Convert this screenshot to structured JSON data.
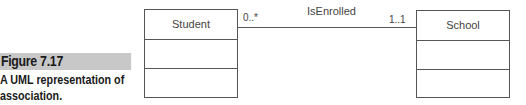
{
  "caption": {
    "figure_label": "Figure 7.17",
    "text": "A UML representation of association."
  },
  "diagram": {
    "classes": [
      {
        "name": "Student"
      },
      {
        "name": "School"
      }
    ],
    "association": {
      "name": "IsEnrolled",
      "source_multiplicity": "0..*",
      "target_multiplicity": "1..1"
    }
  }
}
